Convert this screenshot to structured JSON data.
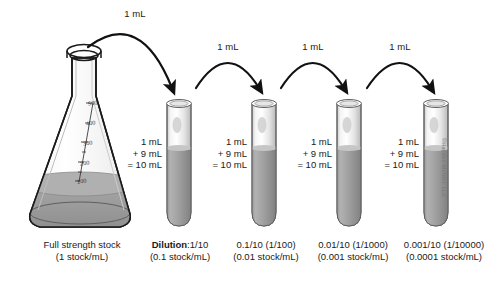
{
  "figure": {
    "copyright": "©Hayden-McNeil, LLC"
  },
  "colors": {
    "liquid": "#9a9a9a",
    "liquid_dark": "#8a8a8a",
    "glass": "#ededed",
    "outline": "#1a1a1a",
    "arrow": "#111111",
    "text": "#1a1a1a"
  },
  "flask": {
    "name": "erlenmeyer-flask",
    "caption_line1": "Full strength stock",
    "caption_line2": "(1 stock/mL)",
    "graduations": [
      "500",
      "400",
      "300",
      "200",
      "100"
    ]
  },
  "transfers": [
    {
      "label": "1 mL"
    },
    {
      "label": "1 mL"
    },
    {
      "label": "1 mL"
    },
    {
      "label": "1 mL"
    }
  ],
  "tubes": [
    {
      "math_line1": "1 mL",
      "math_line2": "+ 9 mL",
      "math_line3": "= 10 mL",
      "caption_bold": "Dilution",
      "caption_rest": ":1/10",
      "caption_line2": "(0.1 stock/mL)"
    },
    {
      "math_line1": "1 mL",
      "math_line2": "+ 9 mL",
      "math_line3": "= 10 mL",
      "caption_bold": "",
      "caption_rest": "0.1/10 (1/100)",
      "caption_line2": "(0.01 stock/mL)"
    },
    {
      "math_line1": "1 mL",
      "math_line2": "+ 9 mL",
      "math_line3": "= 10 mL",
      "caption_bold": "",
      "caption_rest": "0.01/10 (1/1000)",
      "caption_line2": "(0.001 stock/mL)"
    },
    {
      "math_line1": "1 mL",
      "math_line2": "+ 9 mL",
      "math_line3": "= 10 mL",
      "caption_bold": "",
      "caption_rest": "0.001/10 (1/10000)",
      "caption_line2": "(0.0001 stock/mL)"
    }
  ]
}
